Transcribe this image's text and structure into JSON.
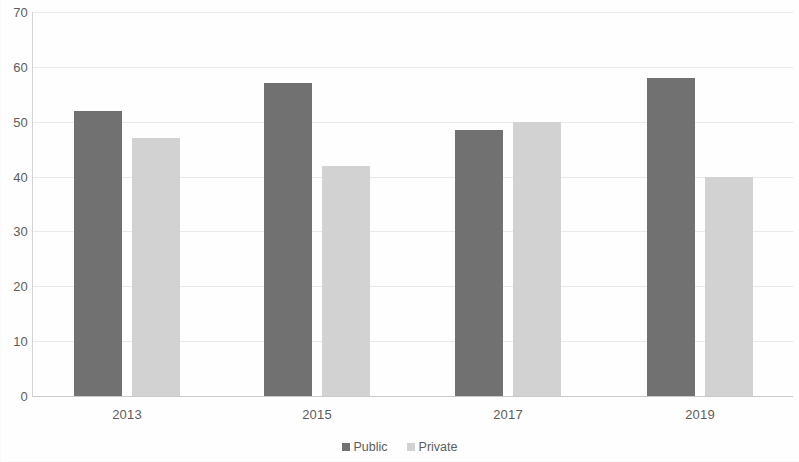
{
  "chart_data": {
    "type": "bar",
    "title": "",
    "subtitle": "",
    "xlabel": "",
    "ylabel": "",
    "categories": [
      "2013",
      "2015",
      "2017",
      "2019"
    ],
    "series": [
      {
        "name": "Public",
        "color": "#717171",
        "values": [
          52,
          57,
          48.5,
          58
        ]
      },
      {
        "name": "Private",
        "color": "#d2d2d2",
        "values": [
          47,
          42,
          50,
          40
        ]
      }
    ],
    "ylim": [
      0,
      70
    ],
    "yticks": [
      0,
      10,
      20,
      30,
      40,
      50,
      60,
      70
    ],
    "ytick_labels": [
      "0",
      "10",
      "20",
      "30",
      "40",
      "50",
      "60",
      "70"
    ],
    "grid": true,
    "grid_axis": "y",
    "legend_position": "bottom",
    "legend_entries": [
      "Public",
      "Private"
    ]
  },
  "colors": {
    "public": "#717171",
    "private": "#d2d2d2",
    "gridline": "#e9e9e9",
    "axis": "#c9c9c9",
    "text": "#5d5d5d",
    "background": "#fefefe"
  }
}
